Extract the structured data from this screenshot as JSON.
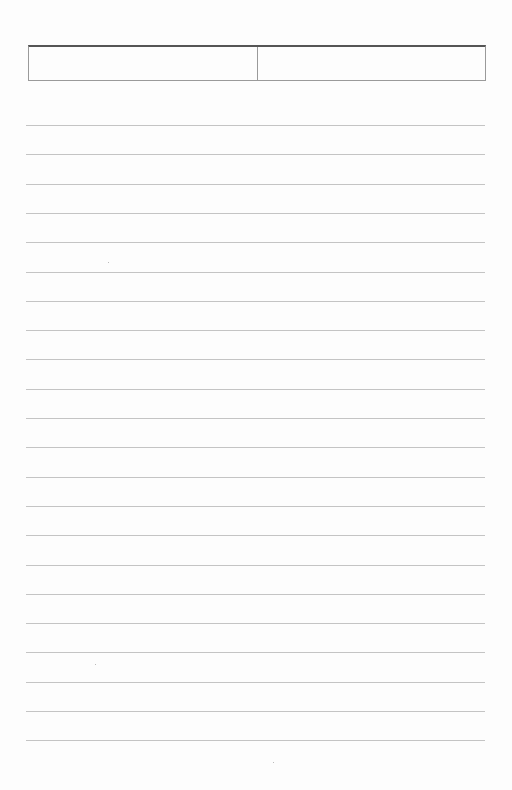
{
  "page": {
    "type": "ruled-sheet",
    "header": {
      "cells": [
        {
          "text": ""
        },
        {
          "text": ""
        }
      ]
    },
    "lines": {
      "count": 22,
      "first_y": 125,
      "spacing": 29.3,
      "entries": [
        "",
        "",
        "",
        "",
        "",
        "",
        "",
        "",
        "",
        "",
        "",
        "",
        "",
        "",
        "",
        "",
        "",
        "",
        "",
        "",
        "",
        ""
      ]
    },
    "colors": {
      "paper": "#fdfdfd",
      "rule": "#c4c4c4",
      "header_top_border": "#555555",
      "header_border": "#9a9a9a"
    }
  }
}
